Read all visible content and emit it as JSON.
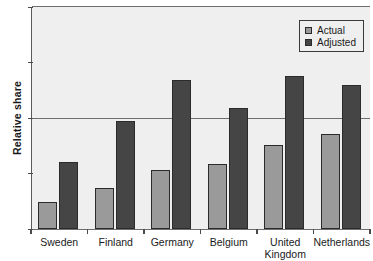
{
  "chart_data": {
    "type": "bar",
    "title": "",
    "xlabel": "",
    "ylabel": "Relative share",
    "ylim": [
      0,
      2
    ],
    "yticks": [
      0,
      1,
      2
    ],
    "ytick_labels": [
      "0",
      "1",
      "2"
    ],
    "yminor_ticks": [
      0.5,
      1.5
    ],
    "grid": true,
    "gridlines": [
      1
    ],
    "legend_position": "top-right",
    "categories": [
      "Sweden",
      "Finland",
      "Germany",
      "Belgium",
      "United Kingdom",
      "Netherlands"
    ],
    "category_lines": [
      [
        "Sweden",
        ""
      ],
      [
        "Finland",
        ""
      ],
      [
        "Germany",
        ""
      ],
      [
        "Belgium",
        ""
      ],
      [
        "United",
        "Kingdom"
      ],
      [
        "Netherlands",
        ""
      ]
    ],
    "series": [
      {
        "name": "Actual",
        "color": "#9a9a9a",
        "values": [
          0.24,
          0.37,
          0.53,
          0.59,
          0.76,
          0.86
        ]
      },
      {
        "name": "Adjusted",
        "color": "#454545",
        "values": [
          0.6,
          0.97,
          1.34,
          1.09,
          1.38,
          1.3
        ]
      }
    ]
  },
  "legend": {
    "items": [
      {
        "label": "Actual"
      },
      {
        "label": "Adjusted"
      }
    ]
  },
  "axis": {
    "y_title": "Relative share"
  },
  "colors": {
    "actual": "#9a9a9a",
    "adjusted": "#454545",
    "plot_background": "#efefef",
    "axis": "#4a4a4a"
  }
}
